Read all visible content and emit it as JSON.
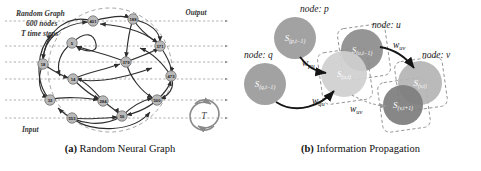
{
  "figure": {
    "panels": [
      {
        "id": "a",
        "caption_tag": "(a)",
        "caption_text": "Random Neural Graph",
        "annotations": {
          "title_line1": "Random Graph",
          "title_line2": "600 nodes",
          "title_line3": "T time steps",
          "output_label": "Output",
          "input_label": "Input",
          "recurrence_symbol": "T",
          "ellipsis": "· · ·"
        },
        "nodes": [
          {
            "label": "401",
            "x": 93,
            "y": 21
          },
          {
            "label": "188",
            "x": 133,
            "y": 19
          },
          {
            "label": "5",
            "x": 72,
            "y": 43
          },
          {
            "label": "371",
            "x": 160,
            "y": 46
          },
          {
            "label": "18",
            "x": 43,
            "y": 64
          },
          {
            "label": "379",
            "x": 126,
            "y": 62
          },
          {
            "label": "14",
            "x": 73,
            "y": 79
          },
          {
            "label": "473",
            "x": 171,
            "y": 76
          },
          {
            "label": "32",
            "x": 50,
            "y": 100
          },
          {
            "label": "284",
            "x": 103,
            "y": 101
          },
          {
            "label": "500",
            "x": 157,
            "y": 100
          },
          {
            "label": "553",
            "x": 72,
            "y": 118
          },
          {
            "label": "56",
            "x": 122,
            "y": 116
          }
        ],
        "io_lines": [
          {
            "y": 21
          },
          {
            "y": 46
          },
          {
            "y": 62
          },
          {
            "y": 79
          },
          {
            "y": 100
          },
          {
            "y": 118
          }
        ],
        "colors": {
          "node_fill": "#b9b9b9",
          "node_stroke": "#6e6e6e",
          "edge": "#2e2e2e",
          "dashed_boundary": "#9a9a9a",
          "io_line": "#8e8e8e"
        }
      },
      {
        "id": "b",
        "caption_tag": "(b)",
        "caption_text": "Information Propagation",
        "node_group_labels": [
          {
            "text": "node: p",
            "x": 60,
            "y": 12
          },
          {
            "text": "node: q",
            "x": 4,
            "y": 58
          },
          {
            "text": "node: u",
            "x": 132,
            "y": 28
          },
          {
            "text": "node: v",
            "x": 182,
            "y": 58
          }
        ],
        "state_nodes": [
          {
            "id": "s_p_tm1",
            "sub_main": "S",
            "sub_idx": "(p,t−1)",
            "cx": 55,
            "cy": 38,
            "r": 21,
            "fill": "#9a9a9a"
          },
          {
            "id": "s_q_tm1",
            "sub_main": "S",
            "sub_idx": "(q,t−1)",
            "cx": 25,
            "cy": 84,
            "r": 21,
            "fill": "#9a9a9a"
          },
          {
            "id": "s_u_tm1",
            "sub_main": "S",
            "sub_idx": "(u,t−1)",
            "cx": 122,
            "cy": 50,
            "r": 21,
            "fill": "#8c8c8c"
          },
          {
            "id": "s_u_t",
            "sub_main": "S",
            "sub_idx": "(u,t)",
            "cx": 104,
            "cy": 74,
            "r": 23,
            "fill": "#cfcfcf"
          },
          {
            "id": "s_v_t",
            "sub_main": "S",
            "sub_idx": "(v,t)",
            "cx": 180,
            "cy": 83,
            "r": 22,
            "fill": "#b4b4b4"
          },
          {
            "id": "s_v_tp1",
            "sub_main": "S",
            "sub_idx": "(v,t+1)",
            "cx": 163,
            "cy": 105,
            "r": 20,
            "fill": "#7d7d7d"
          }
        ],
        "weights": [
          {
            "text": "w",
            "sub": "pu",
            "x": 62,
            "y": 66
          },
          {
            "text": "w",
            "sub": "qu",
            "x": 72,
            "y": 104
          },
          {
            "text": "w",
            "sub": "uv",
            "x": 153,
            "y": 48
          },
          {
            "text": "w",
            "sub": "uv",
            "x": 110,
            "y": 112
          }
        ],
        "colors": {
          "arrow": "#151515",
          "dashed_box": "#8f8f8f",
          "dotted_link": "#9b9b9b"
        }
      }
    ]
  }
}
